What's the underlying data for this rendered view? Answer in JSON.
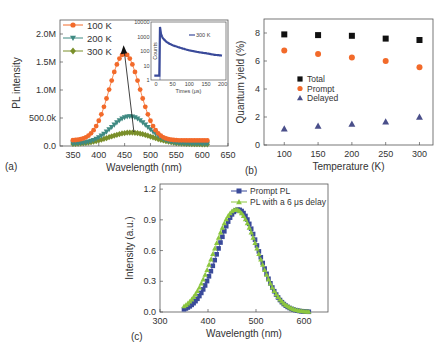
{
  "figure": {
    "panels": [
      "(a)",
      "(b)",
      "(c)"
    ]
  },
  "chart_data": [
    {
      "id": "a",
      "type": "line",
      "title": "",
      "xlabel": "Wavelength (nm)",
      "ylabel": "PL intensity",
      "xlim": [
        325,
        650
      ],
      "ylim": [
        0,
        2250000
      ],
      "xticks": [
        350,
        400,
        450,
        500,
        550,
        600,
        650
      ],
      "yticks": [
        0,
        500000,
        1000000,
        1500000,
        2000000
      ],
      "ytick_labels": [
        "0.0",
        "500.0k",
        "1.0M",
        "1.5M",
        "2.0M"
      ],
      "legend": [
        "100 K",
        "200 K",
        "300 K"
      ],
      "legend_position": "upper left",
      "series": [
        {
          "name": "100 K",
          "color": "#f26a2a",
          "marker": "circle",
          "peak_x": 450,
          "peak_y": 1650000,
          "sigma": 29,
          "baseline": 100000
        },
        {
          "name": "200 K",
          "color": "#3f8a82",
          "marker": "triangle-down",
          "peak_x": 460,
          "peak_y": 530000,
          "sigma": 35,
          "baseline": 40000
        },
        {
          "name": "300 K",
          "color": "#7a8f2a",
          "marker": "diamond",
          "peak_x": 462,
          "peak_y": 240000,
          "sigma": 42,
          "baseline": 30000
        }
      ],
      "x_range": [
        350,
        612
      ],
      "annotation": "arrow from (468, 250000) to (448, 1780000) indicating peak shift",
      "inset": {
        "type": "scatter",
        "xlabel": "Times (μs)",
        "ylabel": "Counts",
        "xlim": [
          -15,
          210
        ],
        "xticks": [
          0,
          50,
          100,
          150,
          200
        ],
        "yscale": "log",
        "yticks": [
          1,
          10,
          100,
          1000,
          10000
        ],
        "ytick_labels": [
          "1",
          "10",
          "100",
          "1000",
          "10000"
        ],
        "legend": "300 K",
        "color": "#3a4a9a",
        "points": [
          [
            -5,
            2
          ],
          [
            5,
            2
          ],
          [
            10,
            2
          ],
          [
            12,
            4500
          ],
          [
            15,
            1500
          ],
          [
            20,
            800
          ],
          [
            30,
            450
          ],
          [
            40,
            320
          ],
          [
            50,
            250
          ],
          [
            75,
            160
          ],
          [
            100,
            110
          ],
          [
            125,
            85
          ],
          [
            150,
            70
          ],
          [
            175,
            55
          ],
          [
            200,
            48
          ]
        ]
      }
    },
    {
      "id": "b",
      "type": "scatter",
      "title": "",
      "xlabel": "Temperature (K)",
      "ylabel": "Quantum yield (%)",
      "xlim": [
        70,
        320
      ],
      "ylim": [
        0,
        9
      ],
      "xticks": [
        100,
        150,
        200,
        250,
        300
      ],
      "yticks": [
        0,
        2,
        4,
        6,
        8
      ],
      "categories": [
        100,
        150,
        200,
        250,
        300
      ],
      "legend": [
        "Total",
        "Prompt",
        "Delayed"
      ],
      "legend_position": "center left",
      "series": [
        {
          "name": "Total",
          "color": "#111111",
          "marker": "square",
          "values": [
            7.9,
            7.85,
            7.8,
            7.6,
            7.5
          ]
        },
        {
          "name": "Prompt",
          "color": "#f26a2a",
          "marker": "circle",
          "values": [
            6.75,
            6.5,
            6.25,
            6.0,
            5.55
          ]
        },
        {
          "name": "Delayed",
          "color": "#4a4f8a",
          "marker": "triangle-up",
          "values": [
            1.15,
            1.35,
            1.5,
            1.65,
            2.0
          ]
        }
      ]
    },
    {
      "id": "c",
      "type": "line",
      "title": "",
      "xlabel": "Wavelength (nm)",
      "ylabel": "Intensity (a.u.)",
      "xlim": [
        300,
        650
      ],
      "ylim": [
        0,
        1.25
      ],
      "xticks": [
        300,
        400,
        500,
        600
      ],
      "yticks": [
        0.0,
        0.3,
        0.6,
        0.9,
        1.2
      ],
      "ytick_labels": [
        "0.0",
        "0.3",
        "0.6",
        "0.9",
        "1.2"
      ],
      "legend": [
        "Prompt PL",
        "PL with a 6 μs delay"
      ],
      "legend_position": "upper right",
      "series": [
        {
          "name": "Prompt PL",
          "color": "#3a4a9a",
          "marker": "square",
          "peak_x": 463,
          "peak_y": 1.0,
          "sigma": 42
        },
        {
          "name": "PL with a 6 μs delay",
          "color": "#8cc63f",
          "marker": "triangle-up",
          "peak_x": 458,
          "peak_y": 1.0,
          "sigma": 45
        }
      ],
      "x_range": [
        350,
        612
      ]
    }
  ]
}
